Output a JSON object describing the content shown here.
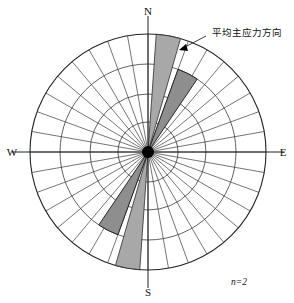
{
  "figure": {
    "type": "rose-diagram",
    "title": "",
    "sample_note": "n=2",
    "annotation": "平均主应力方向"
  },
  "axes": {
    "north": "N",
    "south": "S",
    "east": "E",
    "west": "W"
  },
  "chart_data": {
    "type": "rose",
    "title": "",
    "xlabel": "",
    "ylabel": "",
    "center": {
      "cx": 148,
      "cy": 152
    },
    "radius": 118,
    "sector_width_deg": 10,
    "sector_count": 36,
    "rings": [
      30,
      58,
      88,
      118
    ],
    "ring_count": 4,
    "grid": true,
    "legend": "none",
    "annotations": [
      {
        "text": "平均主应力方向",
        "x": 212,
        "y": 33
      },
      {
        "text": "n=2",
        "x": 233,
        "y": 282
      }
    ],
    "axis_ticks": [
      "N",
      "E",
      "S",
      "W"
    ],
    "petals": [
      {
        "name": "north-petal-outer",
        "start_deg": 4,
        "end_deg": 16,
        "radius": 118,
        "shade": "light"
      },
      {
        "name": "north-petal-inner",
        "start_deg": 20,
        "end_deg": 34,
        "radius": 88,
        "shade": "dark"
      },
      {
        "name": "south-petal-outer",
        "start_deg": 184,
        "end_deg": 196,
        "radius": 118,
        "shade": "light"
      },
      {
        "name": "south-petal-inner",
        "start_deg": 200,
        "end_deg": 214,
        "radius": 88,
        "shade": "dark"
      }
    ],
    "mean_direction_deg": 27
  },
  "colors": {
    "petal_light": "#a8a8a8",
    "petal_dark": "#8e8e8e",
    "grid": "#3a3a3a",
    "outline": "#222222",
    "text": "#111111",
    "background": "#ffffff"
  }
}
